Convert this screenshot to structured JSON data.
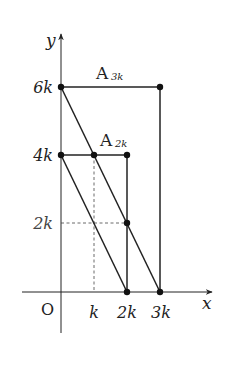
{
  "diagram": {
    "type": "coordinate-geometry",
    "axes": {
      "x_label": "x",
      "y_label": "y",
      "origin_label": "O",
      "x_ticks": [
        "k",
        "2k",
        "3k"
      ],
      "y_ticks": [
        "2k",
        "4k",
        "6k"
      ]
    },
    "labels": {
      "a3k_main": "A",
      "a3k_sub": "3k",
      "a2k_main": "A",
      "a2k_sub": "2k"
    },
    "points": [
      {
        "name": "P_0_6k",
        "x": "0",
        "y": "6k"
      },
      {
        "name": "P_3k_6k",
        "x": "3k",
        "y": "6k"
      },
      {
        "name": "P_0_4k",
        "x": "0",
        "y": "4k"
      },
      {
        "name": "P_k_4k",
        "x": "k",
        "y": "4k"
      },
      {
        "name": "P_2k_4k",
        "x": "2k",
        "y": "4k"
      },
      {
        "name": "P_2k_2k",
        "x": "2k",
        "y": "2k"
      },
      {
        "name": "P_2k_0",
        "x": "2k",
        "y": "0"
      },
      {
        "name": "P_3k_0",
        "x": "3k",
        "y": "0"
      }
    ],
    "segments": [
      {
        "from": "(0,6k)",
        "to": "(3k,6k)",
        "style": "solid"
      },
      {
        "from": "(3k,6k)",
        "to": "(3k,0)",
        "style": "solid"
      },
      {
        "from": "(0,6k)",
        "to": "(3k,0)",
        "style": "solid"
      },
      {
        "from": "(0,4k)",
        "to": "(2k,4k)",
        "style": "solid"
      },
      {
        "from": "(2k,4k)",
        "to": "(2k,0)",
        "style": "solid"
      },
      {
        "from": "(0,4k)",
        "to": "(2k,0)",
        "style": "solid"
      },
      {
        "from": "(k,4k)",
        "to": "(k,0)",
        "style": "dashed"
      },
      {
        "from": "(0,2k)",
        "to": "(2k,2k)",
        "style": "dashed"
      }
    ]
  }
}
